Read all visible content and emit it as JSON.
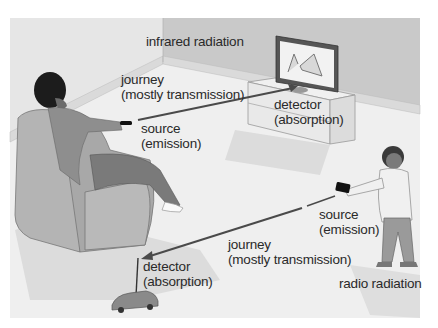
{
  "figure": {
    "type": "illustration",
    "colors": {
      "wall": "#c9c9c9",
      "floor": "#ececec",
      "baseboard": "#e2e2e2",
      "text": "#2a2a2a",
      "ray": "#4a4a4a",
      "shadow": "#d6d6d6"
    }
  },
  "infrared": {
    "title": "infrared radiation",
    "journey": "journey",
    "journey_detail": "(mostly transmission)",
    "source": "source",
    "source_detail": "(emission)",
    "detector": "detector",
    "detector_detail": "(absorption)"
  },
  "radio": {
    "title": "radio radiation",
    "journey": "journey",
    "journey_detail": "(mostly transmission)",
    "source": "source",
    "source_detail": "(emission)",
    "detector": "detector",
    "detector_detail": "(absorption)"
  },
  "objects": {
    "person_in_chair": "man-with-tv-remote-icon",
    "television": "television-icon",
    "child": "child-with-radio-controller-icon",
    "toy_car": "remote-control-car-icon"
  }
}
